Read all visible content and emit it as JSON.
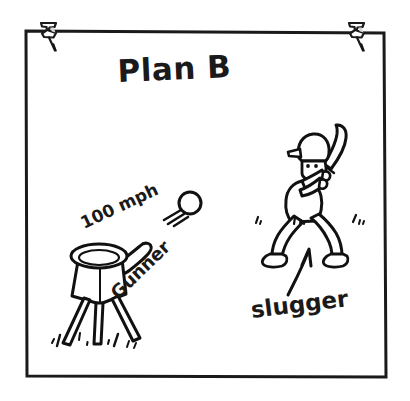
{
  "poster": {
    "title": "Plan B",
    "background_color": "#ffffff",
    "ink_color": "#111111",
    "frame": {
      "name": "poster-frame",
      "x": 25,
      "y": 30,
      "width": 360,
      "height": 348
    }
  },
  "pins": [
    {
      "name": "pushpin-left",
      "x": 47,
      "y": 28,
      "label": "pushpin"
    },
    {
      "name": "pushpin-right",
      "x": 355,
      "y": 28,
      "label": "pushpin"
    }
  ],
  "labels": {
    "speed": "100 mph",
    "machine": "Gunner",
    "batter": "slugger"
  },
  "figures": [
    {
      "name": "pitching-machine",
      "label": "Gunner",
      "description": "funnel-hopper ball launcher on tripod with side handle"
    },
    {
      "name": "baseball",
      "label": "100 mph",
      "description": "ball in flight with three speed lines"
    },
    {
      "name": "batter-figure",
      "label": "slugger",
      "description": "stick-style batter in stance wearing helmet holding bat"
    },
    {
      "name": "pointer-arrow",
      "label": "",
      "description": "curved arrow from slugger label up to batter"
    }
  ],
  "annotations": {
    "speed_rotation_deg": -24,
    "machine_rotation_deg": -44,
    "batter_rotation_deg": -7
  }
}
